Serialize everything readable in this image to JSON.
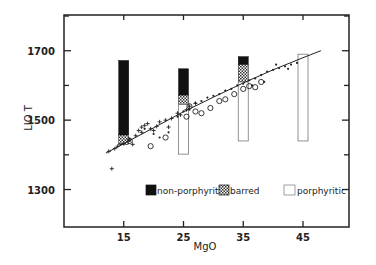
{
  "chart_data": {
    "type": "scatter",
    "title": "",
    "xlabel": "MgO",
    "ylabel": "LIO T",
    "xlim": [
      5,
      52.7
    ],
    "ylim": [
      1192,
      1803
    ],
    "x_ticks": [
      15,
      25,
      35,
      45
    ],
    "x_tick_labels": [
      "15",
      "25",
      "35",
      "45"
    ],
    "y_ticks": [
      1300,
      1400,
      1500,
      1600,
      1700,
      1800
    ],
    "y_tick_labels": [
      "1300",
      "",
      "1500",
      "",
      "1700",
      ""
    ],
    "grid": false,
    "legend_position": "lower-center-inside",
    "legend": [
      {
        "label": "non-porphyritic",
        "style": "solid-black"
      },
      {
        "label": "barred",
        "style": "checker"
      },
      {
        "label": "porphyritic",
        "style": "open"
      }
    ],
    "range_bars": [
      {
        "x": 15,
        "segments": [
          {
            "type": "non-porphyritic",
            "from": 1457,
            "to": 1672
          },
          {
            "type": "barred",
            "from": 1430,
            "to": 1457
          }
        ]
      },
      {
        "x": 25,
        "segments": [
          {
            "type": "non-porphyritic",
            "from": 1572,
            "to": 1648
          },
          {
            "type": "barred",
            "from": 1545,
            "to": 1572
          },
          {
            "type": "porphyritic",
            "from": 1402,
            "to": 1545
          }
        ]
      },
      {
        "x": 35,
        "segments": [
          {
            "type": "non-porphyritic",
            "from": 1660,
            "to": 1683
          },
          {
            "type": "barred",
            "from": 1610,
            "to": 1660
          },
          {
            "type": "porphyritic",
            "from": 1440,
            "to": 1610
          }
        ]
      },
      {
        "x": 45,
        "segments": [
          {
            "type": "porphyritic",
            "from": 1440,
            "to": 1690
          }
        ]
      }
    ],
    "fit_line": {
      "x": [
        12,
        15,
        20,
        25,
        30,
        35,
        40,
        45,
        48
      ],
      "y": [
        1405,
        1432,
        1478,
        1524,
        1566,
        1607,
        1645,
        1680,
        1700
      ]
    },
    "series": [
      {
        "name": "crosses",
        "marker": "+",
        "points": [
          [
            13,
            1360
          ],
          [
            12.5,
            1410
          ],
          [
            13.5,
            1418
          ],
          [
            14,
            1425
          ],
          [
            15,
            1432
          ],
          [
            16,
            1445
          ],
          [
            17,
            1455
          ],
          [
            17.5,
            1470
          ],
          [
            18,
            1480
          ],
          [
            18.5,
            1485
          ],
          [
            19,
            1490
          ],
          [
            19.5,
            1475
          ],
          [
            20,
            1470
          ],
          [
            21,
            1495
          ],
          [
            22,
            1500
          ],
          [
            22.5,
            1480
          ],
          [
            23,
            1505
          ],
          [
            24,
            1520
          ],
          [
            24.5,
            1515
          ],
          [
            25.5,
            1530
          ],
          [
            26,
            1540
          ],
          [
            27,
            1548
          ],
          [
            16.5,
            1430
          ],
          [
            18,
            1465
          ],
          [
            20.5,
            1482
          ]
        ]
      },
      {
        "name": "dots",
        "marker": "•",
        "points": [
          [
            14.5,
            1430
          ],
          [
            16,
            1440
          ],
          [
            18.5,
            1475
          ],
          [
            20,
            1460
          ],
          [
            21,
            1450
          ],
          [
            22.5,
            1465
          ],
          [
            24,
            1510
          ],
          [
            25,
            1525
          ],
          [
            26,
            1530
          ],
          [
            27,
            1550
          ],
          [
            28,
            1555
          ],
          [
            29,
            1565
          ],
          [
            30,
            1570
          ],
          [
            31,
            1575
          ],
          [
            32,
            1585
          ],
          [
            33,
            1590
          ],
          [
            34,
            1600
          ],
          [
            35,
            1605
          ],
          [
            36,
            1615
          ],
          [
            37,
            1620
          ],
          [
            38,
            1630
          ],
          [
            39,
            1640
          ],
          [
            40,
            1645
          ],
          [
            41,
            1650
          ],
          [
            42,
            1655
          ],
          [
            43,
            1660
          ],
          [
            44,
            1665
          ],
          [
            38.5,
            1610
          ],
          [
            36.5,
            1600
          ],
          [
            40.5,
            1660
          ],
          [
            42.5,
            1648
          ]
        ]
      },
      {
        "name": "circles",
        "marker": "o",
        "points": [
          [
            16,
            1440
          ],
          [
            19.5,
            1425
          ],
          [
            22,
            1450
          ],
          [
            26,
            1540
          ],
          [
            28,
            1520
          ],
          [
            29.5,
            1535
          ],
          [
            31,
            1555
          ],
          [
            32,
            1560
          ],
          [
            33.5,
            1575
          ],
          [
            25.5,
            1510
          ],
          [
            27,
            1525
          ],
          [
            35,
            1590
          ],
          [
            36,
            1598
          ],
          [
            37,
            1595
          ],
          [
            38,
            1610
          ]
        ]
      }
    ]
  }
}
